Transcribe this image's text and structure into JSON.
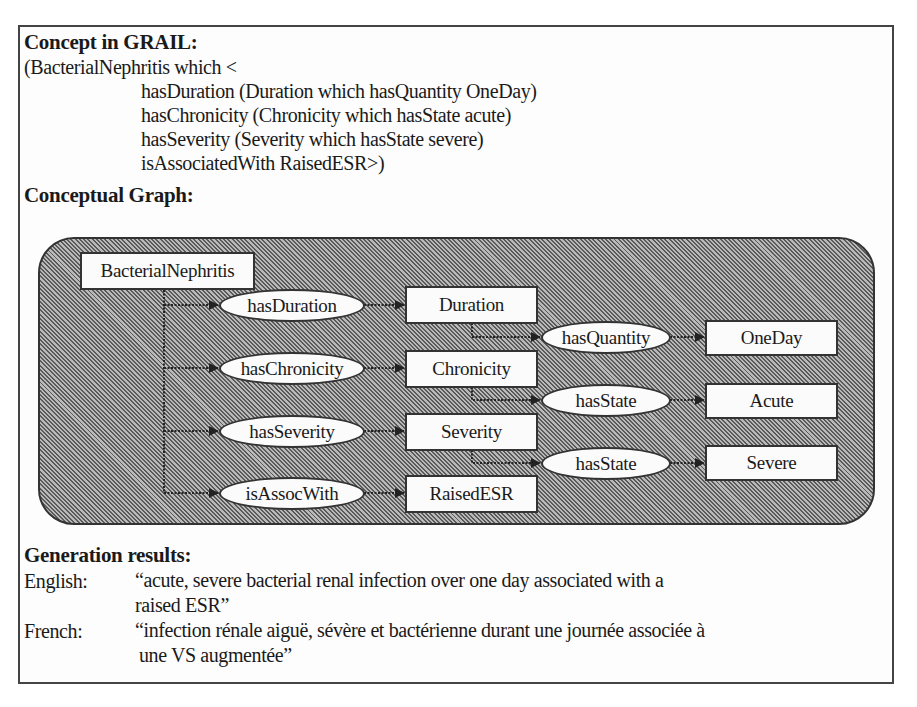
{
  "grail": {
    "heading": "Concept in GRAIL:",
    "lines": [
      "(BacterialNephritis which <",
      "hasDuration (Duration which hasQuantity OneDay)",
      "hasChronicity (Chronicity which hasState acute)",
      "hasSeverity (Severity which hasState severe)",
      "isAssociatedWith RaisedESR>)"
    ]
  },
  "graph": {
    "heading": "Conceptual Graph:",
    "root": "BacterialNephritis",
    "relations_level1": [
      "hasDuration",
      "hasChronicity",
      "hasSeverity",
      "isAssocWith"
    ],
    "concepts_level1": [
      "Duration",
      "Chronicity",
      "Severity",
      "RaisedESR"
    ],
    "relations_level2": [
      "hasQuantity",
      "hasState",
      "hasState"
    ],
    "concepts_level2": [
      "OneDay",
      "Acute",
      "Severe"
    ],
    "colors": {
      "panel_dark": "#5a5a5a",
      "panel_light": "#b9b9b9",
      "node_fill": "#fbfbfb",
      "stroke": "#333333"
    }
  },
  "generation": {
    "heading": "Generation results:",
    "english_label": "English:",
    "english_line1": "“acute, severe bacterial renal infection over one day associated with a",
    "english_line2": "raised ESR”",
    "french_label": "French:",
    "french_line1": "“infection rénale aiguë, sévère et bactérienne durant une journée associée à",
    "french_line2": "une VS augmentée”"
  }
}
